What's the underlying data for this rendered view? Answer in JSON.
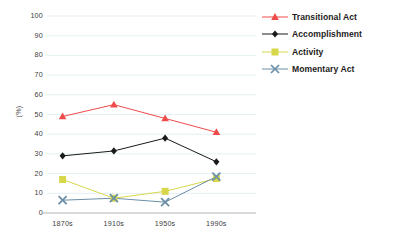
{
  "chart_data": {
    "type": "line",
    "title": "",
    "subtitle": "",
    "xlabel": "",
    "ylabel": "(%)",
    "ylim": [
      0,
      100
    ],
    "ytick_step": 10,
    "yticks": [
      "0",
      "10",
      "20",
      "30",
      "40",
      "50",
      "60",
      "70",
      "80",
      "90",
      "100"
    ],
    "categories": [
      "1870s",
      "1910s",
      "1950s",
      "1990s"
    ],
    "grid": "horizontal",
    "legend_position": "right",
    "series": [
      {
        "name": "Transitional Act",
        "color": "#ef4b4b",
        "marker": "triangle",
        "values": [
          49,
          55,
          48,
          41
        ]
      },
      {
        "name": "Accomplishment",
        "color": "#1a1a1a",
        "marker": "diamond",
        "values": [
          29,
          31.5,
          38,
          26
        ]
      },
      {
        "name": "Activity",
        "color": "#d7d74b",
        "marker": "square",
        "values": [
          17,
          7.5,
          11,
          17.5
        ]
      },
      {
        "name": "Momentary Act",
        "color": "#6b8fa8",
        "marker": "x",
        "values": [
          6.5,
          7.5,
          5.5,
          18.5
        ]
      }
    ]
  },
  "axis": {
    "y_title": "(%)",
    "baseline_color": "#b3b3b3",
    "grid_color": "#e4f0f2",
    "tick_text_color": "#3d3d3d"
  },
  "legend": {
    "items": [
      {
        "label": "Transitional Act",
        "marker": "triangle-marker-icon",
        "color": "#ef4b4b"
      },
      {
        "label": "Accomplishment",
        "marker": "diamond-marker-icon",
        "color": "#1a1a1a"
      },
      {
        "label": "Activity",
        "marker": "square-marker-icon",
        "color": "#d7d74b"
      },
      {
        "label": "Momentary Act",
        "marker": "x-marker-icon",
        "color": "#6b8fa8"
      }
    ]
  }
}
